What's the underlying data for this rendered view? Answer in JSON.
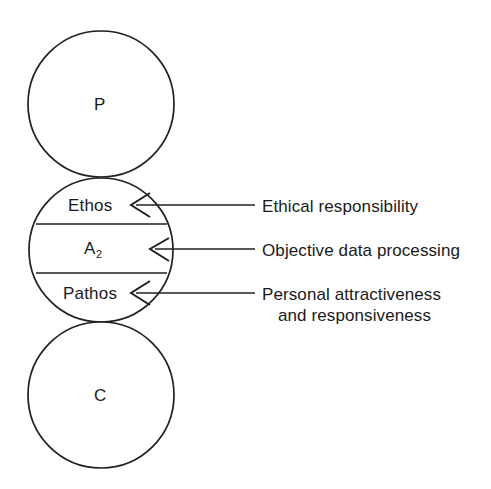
{
  "diagram": {
    "type": "transactional-analysis-ego-state",
    "background_color": "#ffffff",
    "stroke_color": "#202020",
    "circles": [
      {
        "id": "parent",
        "label": "P",
        "cx": 101,
        "cy": 104,
        "r": 73
      },
      {
        "id": "adult",
        "label": "",
        "cx": 101,
        "cy": 250,
        "r": 72
      },
      {
        "id": "child",
        "label": "C",
        "cx": 101,
        "cy": 395,
        "r": 73
      }
    ],
    "adult_segments": [
      {
        "id": "ethos",
        "label": "Ethos",
        "label_x": 68,
        "label_y": 197
      },
      {
        "id": "adult-core",
        "label": "A",
        "subscript": "2",
        "label_x": 84,
        "label_y": 240
      },
      {
        "id": "pathos",
        "label": "Pathos",
        "label_x": 63,
        "label_y": 285
      }
    ],
    "divider_lines": [
      {
        "id": "ethos-adult-divider",
        "y": 224,
        "x1": 36,
        "x2": 167
      },
      {
        "id": "adult-pathos-divider",
        "y": 273,
        "x1": 36,
        "x2": 167
      }
    ],
    "callouts": [
      {
        "id": "ethical-responsibility",
        "text": "Ethical responsibility",
        "text_x": 262,
        "text_y": 196,
        "arrow_tip_x": 133,
        "arrow_y": 205,
        "line_start_x": 255
      },
      {
        "id": "objective-data-processing",
        "text": "Objective data processing",
        "text_x": 262,
        "text_y": 240,
        "arrow_tip_x": 152,
        "arrow_y": 249,
        "line_start_x": 255
      },
      {
        "id": "personal-attractiveness",
        "text": "Personal attractiveness",
        "text_line2": "and responsiveness",
        "text_x": 262,
        "text_y": 284,
        "arrow_tip_x": 133,
        "arrow_y": 293,
        "line_start_x": 255
      }
    ]
  }
}
